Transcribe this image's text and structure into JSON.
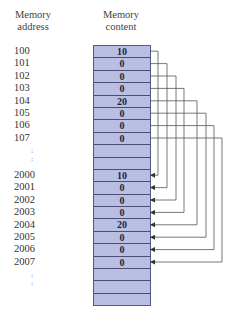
{
  "headers": {
    "address": [
      "Memory",
      "address"
    ],
    "content": [
      "Memory",
      "content"
    ]
  },
  "rows": [
    {
      "address": "100",
      "content": "10"
    },
    {
      "address": "101",
      "content": "0"
    },
    {
      "address": "102",
      "content": "0"
    },
    {
      "address": "103",
      "content": "0"
    },
    {
      "address": "104",
      "content": "20"
    },
    {
      "address": "105",
      "content": "0"
    },
    {
      "address": "106",
      "content": "0"
    },
    {
      "address": "107",
      "content": "0"
    },
    {
      "address": "",
      "content": ""
    },
    {
      "address": "",
      "content": ""
    },
    {
      "address": "2000",
      "content": "10"
    },
    {
      "address": "2001",
      "content": "0"
    },
    {
      "address": "2002",
      "content": "0"
    },
    {
      "address": "2003",
      "content": "0"
    },
    {
      "address": "2004",
      "content": "20"
    },
    {
      "address": "2005",
      "content": "0"
    },
    {
      "address": "2006",
      "content": "0"
    },
    {
      "address": "2007",
      "content": "0"
    },
    {
      "address": "",
      "content": ""
    },
    {
      "address": "",
      "content": ""
    },
    {
      "address": "",
      "content": ""
    }
  ],
  "ellipsis": ":",
  "connections": [
    {
      "from": "100",
      "to": "2000"
    },
    {
      "from": "101",
      "to": "2001"
    },
    {
      "from": "102",
      "to": "2002"
    },
    {
      "from": "103",
      "to": "2003"
    },
    {
      "from": "104",
      "to": "2004"
    },
    {
      "from": "105",
      "to": "2005"
    },
    {
      "from": "106",
      "to": "2006"
    },
    {
      "from": "107",
      "to": "2007"
    }
  ],
  "colors": {
    "cell_fill": "#b9bfe3",
    "cell_border": "#4a4f72",
    "connector": "#444444"
  }
}
